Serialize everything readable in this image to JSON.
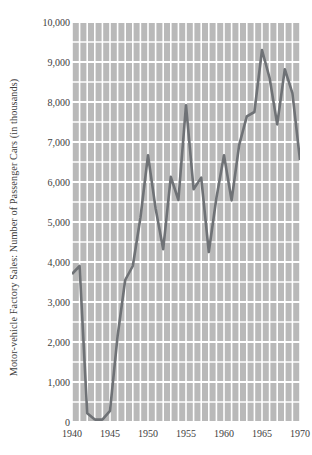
{
  "chart_data": {
    "type": "line",
    "title": "",
    "subtitle": "",
    "xlabel": "",
    "ylabel": "Motor-vehicle Factory Sales: Number of Passenger Cars (in thousands)",
    "xlim": [
      1940,
      1970
    ],
    "ylim": [
      0,
      10000
    ],
    "grid": true,
    "grid_x_step": 1,
    "grid_y_step": 500,
    "legend": "none",
    "x_ticks": [
      1940,
      1945,
      1950,
      1955,
      1960,
      1965,
      1970
    ],
    "x_tick_labels": [
      "1940",
      "1945",
      "1950",
      "1955",
      "1960",
      "1965",
      "1970"
    ],
    "y_ticks": [
      0,
      1000,
      2000,
      3000,
      4000,
      5000,
      6000,
      7000,
      8000,
      9000,
      10000
    ],
    "y_tick_labels": [
      "0",
      "1,000",
      "2,000",
      "3,000",
      "4,000",
      "5,000",
      "6,000",
      "7,000",
      "8,000",
      "9,000",
      "10,000"
    ],
    "line_color": "#6f7276",
    "plot_background": "#b9b9b9",
    "gridline_color": "#ffffff",
    "x": [
      1940,
      1941,
      1942,
      1943,
      1944,
      1945,
      1946,
      1947,
      1948,
      1949,
      1950,
      1951,
      1952,
      1953,
      1954,
      1955,
      1956,
      1957,
      1958,
      1959,
      1960,
      1961,
      1962,
      1963,
      1964,
      1965,
      1966,
      1967,
      1968,
      1969,
      1970
    ],
    "series": [
      {
        "name": "Passenger cars",
        "values": [
          3700,
          3900,
          220,
          60,
          60,
          280,
          2150,
          3550,
          3900,
          5100,
          6670,
          5340,
          4320,
          6130,
          5550,
          7920,
          5820,
          6110,
          4250,
          5600,
          6670,
          5540,
          6930,
          7640,
          7750,
          9300,
          8600,
          7440,
          8820,
          8220,
          6550
        ]
      }
    ]
  }
}
